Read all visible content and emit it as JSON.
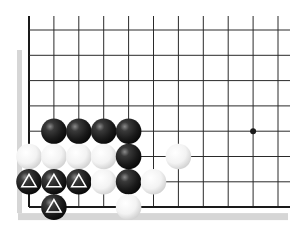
{
  "diagram": {
    "type": "go-board-fragment",
    "grid": {
      "columns": 11,
      "rows": 8,
      "origin_x": 29,
      "origin_y": 30,
      "spacing_x": 24.9,
      "spacing_y": 25.3,
      "right_extend_x": 290,
      "left_edge": true,
      "bottom_edge": true
    },
    "colors": {
      "background": "#ffffff",
      "line": "#2a2a2a",
      "edge_line": "#1a1a1a",
      "shadow": "#d6d6d6",
      "black_stone": "#1e1e1e",
      "white_stone": "#f4f4f4",
      "marker": "#ffffff"
    },
    "star_points": [
      {
        "col": 9,
        "row": 4
      }
    ],
    "stones": [
      {
        "color": "black",
        "col": 1,
        "row": 4,
        "mark": ""
      },
      {
        "color": "black",
        "col": 2,
        "row": 4,
        "mark": ""
      },
      {
        "color": "black",
        "col": 3,
        "row": 4,
        "mark": ""
      },
      {
        "color": "black",
        "col": 4,
        "row": 4,
        "mark": ""
      },
      {
        "color": "white",
        "col": 0,
        "row": 5,
        "mark": ""
      },
      {
        "color": "white",
        "col": 1,
        "row": 5,
        "mark": ""
      },
      {
        "color": "white",
        "col": 2,
        "row": 5,
        "mark": ""
      },
      {
        "color": "white",
        "col": 3,
        "row": 5,
        "mark": ""
      },
      {
        "color": "black",
        "col": 4,
        "row": 5,
        "mark": ""
      },
      {
        "color": "white",
        "col": 6,
        "row": 5,
        "mark": ""
      },
      {
        "color": "black",
        "col": 0,
        "row": 6,
        "mark": "triangle"
      },
      {
        "color": "black",
        "col": 1,
        "row": 6,
        "mark": "triangle"
      },
      {
        "color": "black",
        "col": 2,
        "row": 6,
        "mark": "triangle"
      },
      {
        "color": "white",
        "col": 3,
        "row": 6,
        "mark": ""
      },
      {
        "color": "black",
        "col": 4,
        "row": 6,
        "mark": ""
      },
      {
        "color": "white",
        "col": 5,
        "row": 6,
        "mark": ""
      },
      {
        "color": "black",
        "col": 1,
        "row": 7,
        "mark": "triangle"
      },
      {
        "color": "white",
        "col": 4,
        "row": 7,
        "mark": ""
      }
    ]
  }
}
